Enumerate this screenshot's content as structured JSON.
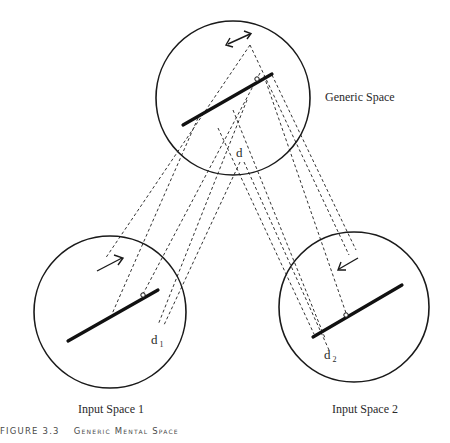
{
  "figure": {
    "label": "FIGURE 3.3",
    "title": "Generic Mental Space"
  },
  "spaces": {
    "generic": {
      "label": "Generic Space",
      "point_label": "d"
    },
    "input1": {
      "label": "Input Space 1",
      "point_label": "d",
      "point_subscript": "1"
    },
    "input2": {
      "label": "Input Space 2",
      "point_label": "d",
      "point_subscript": "2"
    }
  },
  "colors": {
    "stroke": "#1a1a1a",
    "dashed": "#333333",
    "text": "#2a2a2a"
  }
}
